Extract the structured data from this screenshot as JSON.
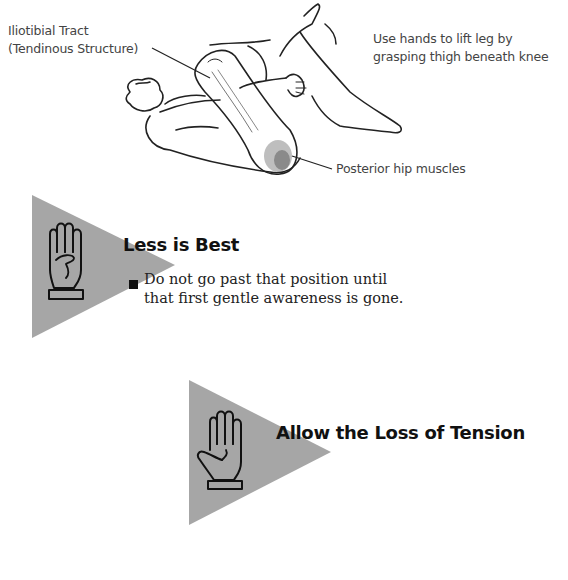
{
  "illustration": {
    "labels": {
      "iliotibial_line1": "Iliotibial Tract",
      "iliotibial_line2": "(Tendinous Structure)",
      "instruction_line1": "Use hands to lift leg by",
      "instruction_line2": "grasping thigh beneath knee",
      "posterior": "Posterior hip muscles"
    }
  },
  "tips": [
    {
      "icon": "four-fingers-hand-icon",
      "heading": "Less is Best",
      "bullets": [
        {
          "line1": "Do not go past that position until",
          "line2": "that first gentle awareness is gone."
        }
      ]
    },
    {
      "icon": "open-hand-icon",
      "heading": "Allow the Loss of Tension"
    }
  ],
  "colors": {
    "triangle": "#a6a6a6",
    "text": "#222222",
    "label": "#444444"
  }
}
